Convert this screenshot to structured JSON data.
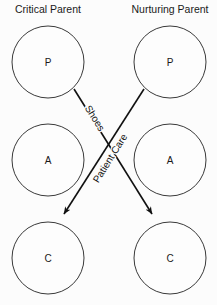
{
  "diagram": {
    "type": "transactional-analysis-crossed-transaction",
    "width": 217,
    "height": 305,
    "background_color": "#fcfcfc",
    "line_color": "#111111",
    "circle_stroke_color": "#3a3a3a",
    "text_color": "#1a1a1a",
    "columns": [
      {
        "id": "left",
        "heading": "Critical Parent",
        "center_x": 48
      },
      {
        "id": "right",
        "heading": "Nurturing Parent",
        "center_x": 170
      }
    ],
    "rows": [
      {
        "id": "parent",
        "label": "P",
        "center_y": 62
      },
      {
        "id": "adult",
        "label": "A",
        "center_y": 160
      },
      {
        "id": "child",
        "label": "C",
        "center_y": 258
      }
    ],
    "circles": [
      {
        "id": "left-parent",
        "label": "P",
        "cx": 48,
        "cy": 62,
        "r": 36
      },
      {
        "id": "right-parent",
        "label": "P",
        "cx": 170,
        "cy": 62,
        "r": 36
      },
      {
        "id": "left-adult",
        "label": "A",
        "cx": 48,
        "cy": 160,
        "r": 36
      },
      {
        "id": "right-adult",
        "label": "A",
        "cx": 170,
        "cy": 160,
        "r": 36
      },
      {
        "id": "left-child",
        "label": "C",
        "cx": 48,
        "cy": 258,
        "r": 36
      },
      {
        "id": "right-child",
        "label": "C",
        "cx": 170,
        "cy": 258,
        "r": 36
      }
    ],
    "arrows": [
      {
        "id": "patient-care-arrow",
        "label": "Patient Care",
        "from": "left-parent",
        "to": "right-child",
        "x1": 74,
        "y1": 89,
        "x2": 152,
        "y2": 214,
        "label_x": 113,
        "label_y": 160,
        "label_rotation": -58
      },
      {
        "id": "shoes-arrow",
        "label": "Shoes",
        "from": "right-parent",
        "to": "left-child",
        "x1": 144,
        "y1": 89,
        "x2": 64,
        "y2": 214,
        "label_x": 92,
        "label_y": 120,
        "label_rotation": 58
      }
    ],
    "headings": {
      "left_x": 48,
      "right_x": 170,
      "y": 12
    }
  }
}
